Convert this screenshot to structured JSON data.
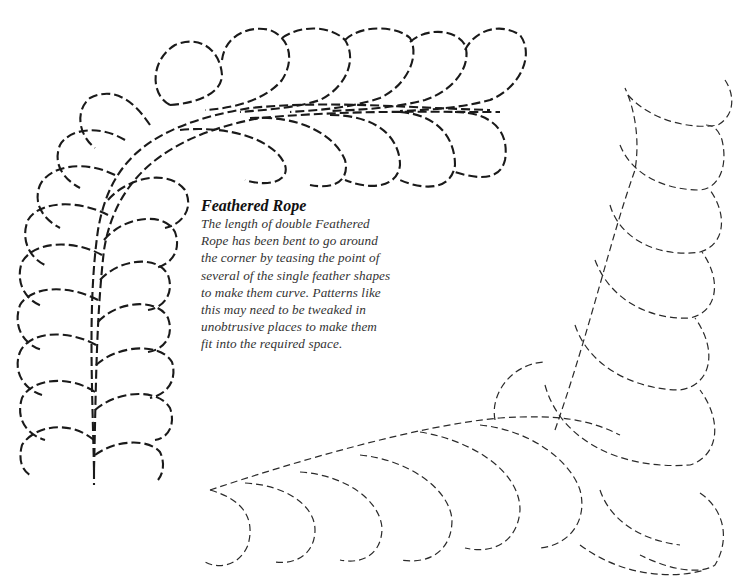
{
  "caption": {
    "title": "Feathered Rope",
    "body_lines": [
      "The length of double Feathered",
      "Rope has been bent to go around",
      "the corner by teasing the point of",
      "several of the single feather shapes",
      "to make them curve. Patterns like",
      "this may need to be tweaked in",
      "unobtrusive places to make them",
      "fit into the required space."
    ]
  },
  "illustrations": [
    {
      "name": "feathered-rope-corner-left",
      "style": "heavy dashed",
      "color": "#1a1a1a"
    },
    {
      "name": "feathered-rope-corner-right",
      "style": "light dashed",
      "color": "#2a2a2a"
    }
  ]
}
